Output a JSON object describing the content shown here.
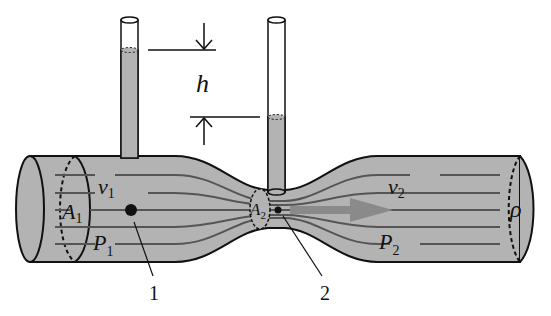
{
  "diagram": {
    "labels": {
      "h": "h",
      "v1": "v",
      "v1_sub": "1",
      "A1": "A",
      "A1_sub": "1",
      "P1": "P",
      "P1_sub": "1",
      "A2": "A",
      "A2_sub": "2",
      "v2": "v",
      "v2_sub": "2",
      "P2": "P",
      "P2_sub": "2",
      "rho": "ρ",
      "point1": "1",
      "point2": "2"
    },
    "colors": {
      "fluid": "#b3b3b3",
      "stroke": "#111111",
      "streamline": "#555555",
      "arrow": "#8a8a8a"
    }
  }
}
